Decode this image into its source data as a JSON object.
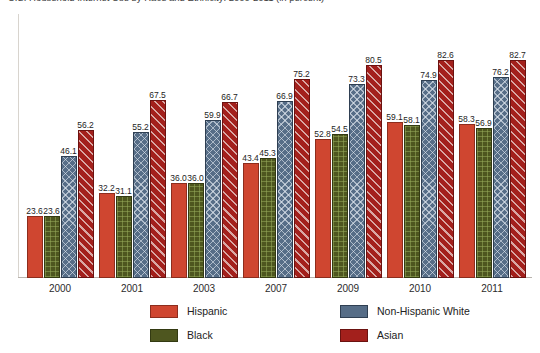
{
  "chart_data": {
    "type": "bar",
    "title": "U.S. Household Internet Use by Race and Ethnicity: 2000-2011 (in percent)",
    "xlabel": "",
    "ylabel": "",
    "ylim": [
      0,
      100
    ],
    "grid": false,
    "legend_position": "bottom",
    "categories": [
      "2000",
      "2001",
      "2003",
      "2007",
      "2009",
      "2010",
      "2011"
    ],
    "series": [
      {
        "name": "Hispanic",
        "color": "#cf4630",
        "pattern": "solid",
        "values": [
          23.6,
          32.2,
          36.0,
          43.4,
          52.8,
          59.1,
          58.3
        ]
      },
      {
        "name": "Black",
        "color": "#4e561f",
        "pattern": "grid",
        "values": [
          23.6,
          31.1,
          36.0,
          45.3,
          54.5,
          58.1,
          56.9
        ]
      },
      {
        "name": "Non-Hispanic White",
        "color": "#566d87",
        "pattern": "diamond",
        "values": [
          46.1,
          55.2,
          59.9,
          66.9,
          73.3,
          74.9,
          76.2
        ]
      },
      {
        "name": "Asian",
        "color": "#a3201c",
        "pattern": "stripe",
        "values": [
          56.2,
          67.5,
          66.7,
          75.2,
          80.5,
          82.6,
          82.7
        ]
      }
    ]
  },
  "legend": {
    "items": [
      {
        "label": "Hispanic"
      },
      {
        "label": "Black"
      },
      {
        "label": "Non-Hispanic White"
      },
      {
        "label": "Asian"
      }
    ]
  }
}
